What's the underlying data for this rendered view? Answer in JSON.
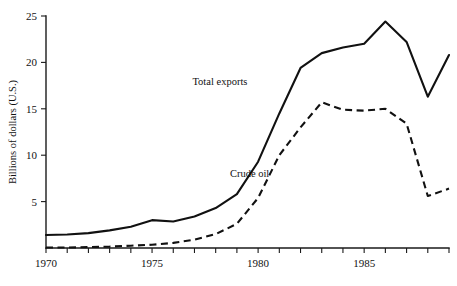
{
  "chart_data": {
    "type": "line",
    "title": "",
    "subtitle": "",
    "xlabel": "",
    "ylabel": "Billions of dollars (U.S.)",
    "xlim": [
      1970,
      1989
    ],
    "ylim": [
      0,
      25
    ],
    "grid": false,
    "legend_position": "inline-annotations",
    "x_ticks": [
      1970,
      1971,
      1972,
      1973,
      1974,
      1975,
      1976,
      1977,
      1978,
      1979,
      1980,
      1981,
      1982,
      1983,
      1984,
      1985,
      1986,
      1987,
      1988,
      1989
    ],
    "x_tick_labels": [
      "1970",
      "",
      "",
      "",
      "",
      "1975",
      "",
      "",
      "",
      "",
      "1980",
      "",
      "",
      "",
      "",
      "1985",
      "",
      "",
      "",
      ""
    ],
    "y_ticks": [
      5,
      10,
      15,
      20,
      25
    ],
    "y_tick_labels": [
      "5",
      "10",
      "15",
      "20",
      "25"
    ],
    "x": [
      1970,
      1971,
      1972,
      1973,
      1974,
      1975,
      1976,
      1977,
      1978,
      1979,
      1980,
      1981,
      1982,
      1983,
      1984,
      1985,
      1986,
      1987,
      1988,
      1989
    ],
    "series": [
      {
        "name": "Total exports",
        "style": "solid",
        "color": "#111111",
        "label_text": "Total exports",
        "label_x": 1978.2,
        "label_y": 17.6,
        "values": [
          1.4,
          1.45,
          1.6,
          1.9,
          2.3,
          3.0,
          2.85,
          3.4,
          4.3,
          5.8,
          9.3,
          14.5,
          19.4,
          21.0,
          21.6,
          22.0,
          24.4,
          22.2,
          16.3,
          20.8
        ]
      },
      {
        "name": "Crude oil",
        "style": "dashed",
        "color": "#111111",
        "label_text": "Crude oil",
        "label_x": 1979.6,
        "label_y": 7.6,
        "values": [
          0.05,
          0.05,
          0.1,
          0.15,
          0.25,
          0.35,
          0.55,
          0.9,
          1.5,
          2.6,
          5.4,
          10.0,
          13.0,
          15.7,
          14.9,
          14.8,
          15.0,
          13.4,
          5.6,
          6.4
        ]
      }
    ],
    "series_extra": {
      "total_exports_tail": [
        20.8,
        20.8,
        23.3
      ],
      "crude_oil_tail": [
        7.8,
        5.9,
        7.3
      ]
    }
  },
  "axis": {
    "y_axis_label": "Billions of dollars (U.S.)"
  }
}
